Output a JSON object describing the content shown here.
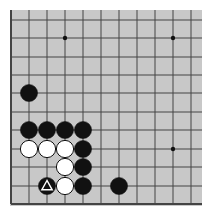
{
  "diagram": {
    "type": "go-board-fragment",
    "board_color": "#c8c8c8",
    "line_color": "#444444",
    "grid": {
      "cols_x": [
        11,
        29,
        47,
        65,
        83,
        101,
        119,
        137,
        155,
        173,
        191
      ],
      "rows_y": [
        20,
        38,
        57,
        75,
        93,
        112,
        130,
        149,
        167,
        186,
        204
      ],
      "left_edge": true,
      "bottom_edge": true,
      "top_edge": false,
      "right_edge": false
    },
    "star_points": [
      {
        "col": 3,
        "row": 1
      },
      {
        "col": 9,
        "row": 1
      },
      {
        "col": 9,
        "row": 7
      }
    ],
    "stones": [
      {
        "color": "black",
        "col": 1,
        "row": 4
      },
      {
        "color": "black",
        "col": 1,
        "row": 6
      },
      {
        "color": "black",
        "col": 2,
        "row": 6
      },
      {
        "color": "black",
        "col": 3,
        "row": 6
      },
      {
        "color": "black",
        "col": 4,
        "row": 6
      },
      {
        "color": "white",
        "col": 1,
        "row": 7
      },
      {
        "color": "white",
        "col": 2,
        "row": 7
      },
      {
        "color": "white",
        "col": 3,
        "row": 7
      },
      {
        "color": "black",
        "col": 4,
        "row": 7
      },
      {
        "color": "white",
        "col": 3,
        "row": 8
      },
      {
        "color": "black",
        "col": 4,
        "row": 8
      },
      {
        "color": "black",
        "col": 2,
        "row": 9,
        "marker": "triangle"
      },
      {
        "color": "white",
        "col": 3,
        "row": 9
      },
      {
        "color": "black",
        "col": 4,
        "row": 9
      },
      {
        "color": "black",
        "col": 6,
        "row": 9
      }
    ]
  }
}
